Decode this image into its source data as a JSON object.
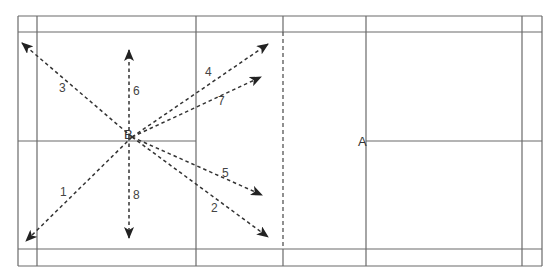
{
  "court": {
    "outer": {
      "x1": 18,
      "y1": 16,
      "x2": 542,
      "y2": 266
    },
    "side_inner_left_x": 37,
    "side_inner_right_x": 522,
    "back_inner_top_y": 32,
    "back_inner_bottom_y": 249,
    "short_service_left_x": 196,
    "short_service_right_x": 366,
    "net_x": 283,
    "center_line_y": 141,
    "line_color": "#6a6a6a"
  },
  "points": {
    "B": {
      "label": "B",
      "x": 132,
      "y": 137
    },
    "A": {
      "label": "A",
      "x": 358,
      "y": 143
    }
  },
  "shots": [
    {
      "id": "1",
      "label": "1",
      "from": [
        132,
        137
      ],
      "to": [
        26,
        241
      ],
      "label_pos": [
        60,
        186
      ]
    },
    {
      "id": "2",
      "label": "2",
      "from": [
        132,
        137
      ],
      "to": [
        268,
        237
      ],
      "label_pos": [
        211,
        202
      ]
    },
    {
      "id": "3",
      "label": "3",
      "from": [
        132,
        137
      ],
      "to": [
        22,
        43
      ],
      "label_pos": [
        59,
        82
      ]
    },
    {
      "id": "4",
      "label": "4",
      "from": [
        132,
        137
      ],
      "to": [
        268,
        44
      ],
      "label_pos": [
        205,
        66
      ]
    },
    {
      "id": "5",
      "label": "5",
      "from": [
        132,
        137
      ],
      "to": [
        262,
        195
      ],
      "label_pos": [
        222,
        167
      ]
    },
    {
      "id": "6",
      "label": "6",
      "from": [
        129,
        137
      ],
      "to": [
        129,
        50
      ],
      "label_pos": [
        133,
        85
      ]
    },
    {
      "id": "7",
      "label": "7",
      "from": [
        132,
        137
      ],
      "to": [
        261,
        77
      ],
      "label_pos": [
        218,
        95
      ]
    },
    {
      "id": "8",
      "label": "8",
      "from": [
        129,
        137
      ],
      "to": [
        129,
        238
      ],
      "label_pos": [
        133,
        189
      ]
    }
  ],
  "arrow_color": "#222222"
}
